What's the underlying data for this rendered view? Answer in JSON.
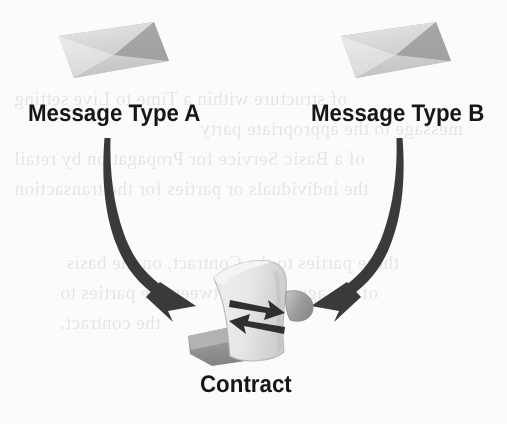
{
  "figure": {
    "kind": "concept-diagram",
    "background_color": "#fbfbfa",
    "text_color": "#161616"
  },
  "nodes": {
    "message_a": {
      "label": "Message Type A",
      "icon": "envelope-icon"
    },
    "message_b": {
      "label": "Message Type B",
      "icon": "envelope-icon"
    },
    "contract": {
      "label": "Contract",
      "icon": "scroll-exchange-icon"
    }
  },
  "connectors": [
    {
      "name": "arrow-a-to-contract",
      "from": "message_a",
      "to": "contract",
      "style": "curved-arrow",
      "color": "#3a3a3a"
    },
    {
      "name": "arrow-b-to-contract",
      "from": "message_b",
      "to": "contract",
      "style": "curved-arrow",
      "color": "#3a3a3a"
    }
  ],
  "palette": {
    "envelope_body": "#a9a9a9",
    "envelope_flap": "#d6d6d6",
    "envelope_light": "#ededed",
    "arrow": "#3a3a3a",
    "scroll_paper": "#e4e4e4",
    "scroll_shade": "#a8a8a8",
    "scroll_dark": "#8e8e8e",
    "scroll_arrow": "#2f2f2f"
  },
  "bleedthrough": {
    "note": "faint mirrored show-through text from the reverse side of the scanned page",
    "lines": [
      {
        "text": "of structure within a Time to Live setting",
        "x": 14,
        "y": 88
      },
      {
        "text": "message to the appropriate party",
        "x": 200,
        "y": 118
      },
      {
        "text": "of a Basic Service for Propagation by retail",
        "x": 14,
        "y": 148
      },
      {
        "text": "the individuals or parties for the transaction",
        "x": 14,
        "y": 178
      },
      {
        "text": "these parties to the Contract, on the basis",
        "x": 66,
        "y": 252
      },
      {
        "text": "of the agreement between the parties to",
        "x": 60,
        "y": 282
      },
      {
        "text": "the contract.",
        "x": 60,
        "y": 312
      }
    ]
  }
}
